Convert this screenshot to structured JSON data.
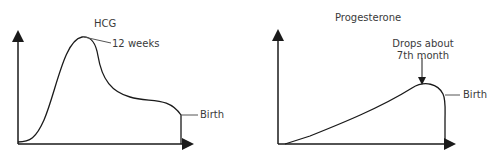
{
  "diagrams": [
    {
      "title": "HCG",
      "annotations": {
        "peak": "12 weeks",
        "end": "Birth"
      }
    },
    {
      "title": "Progesterone",
      "annotations": {
        "peak_line1": "Drops about",
        "peak_line2": "7th month",
        "end": "Birth"
      }
    }
  ],
  "colors": {
    "line": "#1a1a1a",
    "text": "#3a3a3a"
  }
}
